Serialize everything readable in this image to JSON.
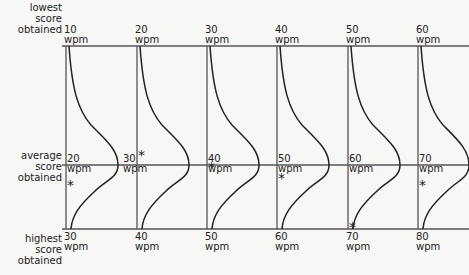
{
  "row_labels": {
    "top": [
      "lowest",
      "score",
      "obtained"
    ],
    "middle": [
      "average",
      "score",
      "obtained"
    ],
    "bottom": [
      "highest",
      "score",
      "obtained"
    ]
  },
  "unit": "wpm",
  "columns": [
    {
      "low": "10",
      "avg": "20",
      "high": "30"
    },
    {
      "low": "20",
      "avg": "30",
      "high": "40"
    },
    {
      "low": "30",
      "avg": "40",
      "high": "50"
    },
    {
      "low": "40",
      "avg": "50",
      "high": "60"
    },
    {
      "low": "50",
      "avg": "60",
      "high": "70"
    },
    {
      "low": "60",
      "avg": "70",
      "high": "80"
    }
  ],
  "star_glyph": "*",
  "colors": {
    "line": "#555555",
    "curve": "#222222",
    "background": "#f7f7f5"
  }
}
